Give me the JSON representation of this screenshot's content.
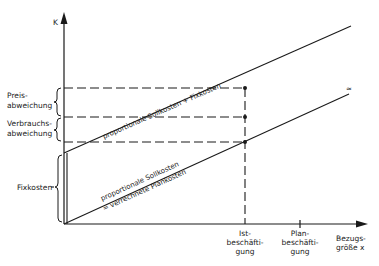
{
  "diagram": {
    "y_axis_label": "K",
    "x_axis_label_line1": "Bezugs-",
    "x_axis_label_line2": "größe x",
    "left_labels": {
      "preis_line1": "Preis-",
      "preis_line2": "abweichung",
      "verbrauch_line1": "Verbrauchs-",
      "verbrauch_line2": "abweichung",
      "fixkosten": "Fixkosten"
    },
    "x_ticks": {
      "ist_line1": "Ist-",
      "ist_line2": "beschäfti-",
      "ist_line3": "gung",
      "plan_line1": "Plan-",
      "plan_line2": "beschäfti-",
      "plan_line3": "gung"
    },
    "lines": {
      "upper_label": "proportionale Sollkosten + Fixkosten",
      "lower_label_line1": "proportionale Sollkosten",
      "lower_label_line2": "= verrechnete Plankosten"
    },
    "colors": {
      "ink": "#1a1a1a",
      "background": "#ffffff"
    }
  }
}
